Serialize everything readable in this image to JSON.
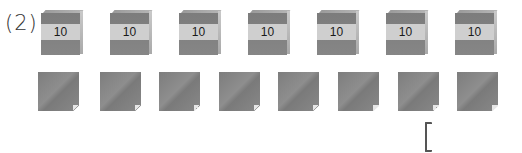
{
  "problem": {
    "label": "(2)",
    "blocks": {
      "count": 7,
      "items": [
        {
          "value": "10",
          "x": 41
        },
        {
          "value": "10",
          "x": 110
        },
        {
          "value": "10",
          "x": 179
        },
        {
          "value": "10",
          "x": 248
        },
        {
          "value": "10",
          "x": 317
        },
        {
          "value": "10",
          "x": 386
        },
        {
          "value": "10",
          "x": 455
        }
      ]
    },
    "sheets": {
      "count": 8,
      "items": [
        {
          "x": 38
        },
        {
          "x": 100
        },
        {
          "x": 159
        },
        {
          "x": 219
        },
        {
          "x": 278
        },
        {
          "x": 338
        },
        {
          "x": 398
        },
        {
          "x": 457
        }
      ]
    },
    "answer_bracket": {
      "value": ""
    },
    "colors": {
      "block_face": "#808080",
      "block_band": "#cfcfcf",
      "sheet": "#858585",
      "text": "#1a1a1a"
    }
  }
}
